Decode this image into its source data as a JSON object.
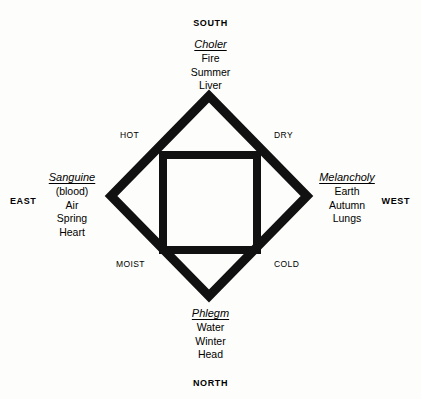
{
  "diagram": {
    "stroke_color": "#111111",
    "background_color": "#fdfdfb",
    "diamond": {
      "center_x": 209,
      "center_y": 196,
      "half_width": 98,
      "half_height": 100,
      "stroke_width": 9
    },
    "inner_square": {
      "left": 163,
      "top": 155,
      "width": 94,
      "height": 95,
      "stroke_width": 8
    }
  },
  "cardinals": {
    "south": "SOUTH",
    "north": "NORTH",
    "east": "EAST",
    "west": "WEST"
  },
  "qualities": {
    "hot": "HOT",
    "dry": "DRY",
    "moist": "MOIST",
    "cold": "COLD"
  },
  "humours": {
    "choler": {
      "title": "Choler",
      "lines": [
        "Fire",
        "Summer",
        "Liver"
      ]
    },
    "sanguine": {
      "title": "Sanguine",
      "lines": [
        "(blood)",
        "Air",
        "Spring",
        "Heart"
      ]
    },
    "melancholy": {
      "title": "Melancholy",
      "lines": [
        "Earth",
        "Autumn",
        "Lungs"
      ]
    },
    "phlegm": {
      "title": "Phlegm",
      "lines": [
        "Water",
        "Winter",
        "Head"
      ]
    }
  }
}
